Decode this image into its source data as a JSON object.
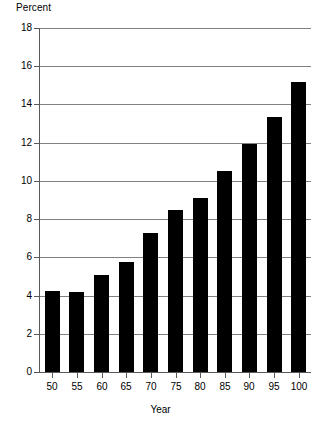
{
  "chart_data": {
    "type": "bar",
    "title": "",
    "subtitle": "",
    "xlabel": "Year",
    "ylabel": "Percent",
    "categories": [
      "50",
      "55",
      "60",
      "65",
      "70",
      "75",
      "80",
      "85",
      "90",
      "95",
      "100"
    ],
    "values": [
      4.25,
      4.2,
      5.1,
      5.75,
      7.25,
      8.5,
      9.1,
      10.5,
      11.95,
      13.35,
      15.15
    ],
    "series": [
      {
        "name": "Percent",
        "values": [
          4.25,
          4.2,
          5.1,
          5.75,
          7.25,
          8.5,
          9.1,
          10.5,
          11.95,
          13.35,
          15.15
        ]
      }
    ],
    "ylim": [
      0,
      18
    ],
    "yticks": [
      0,
      2,
      4,
      6,
      8,
      10,
      12,
      14,
      16,
      18
    ],
    "ytick_labels": [
      "0",
      "2",
      "4",
      "6",
      "8",
      "10",
      "12",
      "14",
      "16",
      "18"
    ],
    "grid": "horizontal",
    "legend": "none",
    "bar_color": "#000000",
    "grid_color": "#808080",
    "axis_color": "#595959",
    "background": "#ffffff",
    "annotations": []
  }
}
